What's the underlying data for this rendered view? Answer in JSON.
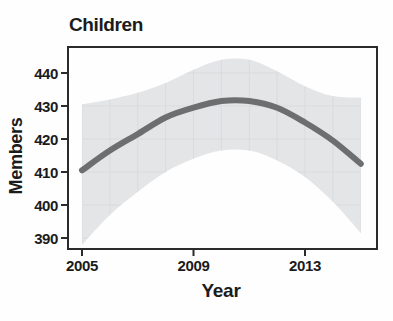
{
  "colors": {
    "background": "#fefefe",
    "text": "#1b1b1b",
    "frame": "#2b2b2b",
    "trend_line": "#6c6e70",
    "confidence_band": "#e4e5e7",
    "band_grid": "#d9dbdd"
  },
  "chart_data": {
    "type": "line",
    "title": "Children",
    "xlabel": "Year",
    "ylabel": "Members",
    "x": [
      2005,
      2006,
      2007,
      2008,
      2009,
      2010,
      2011,
      2012,
      2013,
      2014,
      2015
    ],
    "series": [
      {
        "name": "Children members (smoothed trend)",
        "values": [
          410.5,
          416.5,
          421.5,
          426.5,
          429.5,
          431.5,
          431.5,
          429.5,
          425,
          419.5,
          412.5
        ]
      }
    ],
    "confidence_band": {
      "name": "confidence interval",
      "upper": [
        430.5,
        432,
        434,
        437,
        441,
        444,
        444,
        440.5,
        436,
        433,
        432.5
      ],
      "lower": [
        388,
        397,
        404,
        410,
        414,
        416.5,
        416.5,
        413.5,
        408.5,
        401,
        391.5
      ]
    },
    "xticks": [
      2005,
      2009,
      2013
    ],
    "yticks": [
      390,
      400,
      410,
      420,
      430,
      440
    ],
    "xlim": [
      2004.5,
      2015.6
    ],
    "ylim": [
      386.5,
      447.5
    ],
    "grid": "faint yearly/10-unit gridlines visible only over confidence band",
    "legend_position": "none"
  }
}
